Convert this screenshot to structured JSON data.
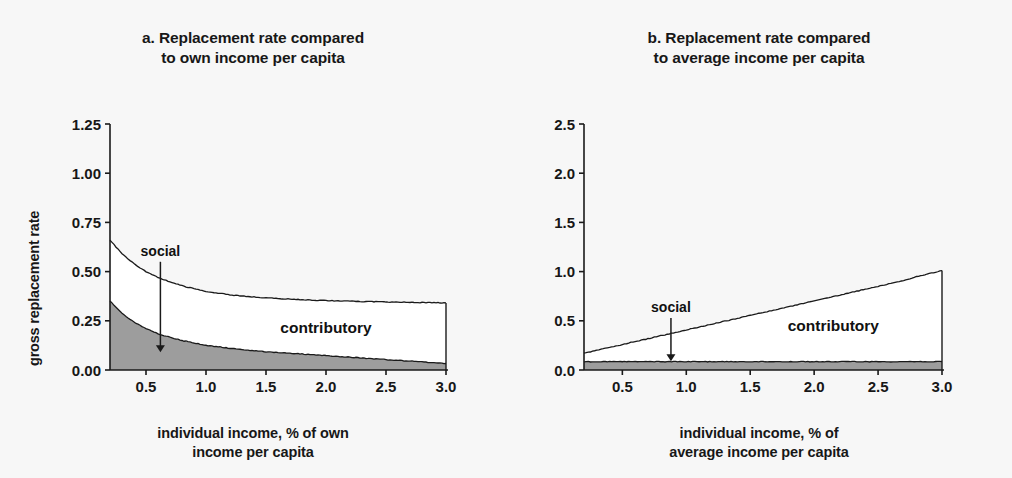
{
  "figure": {
    "background_color": "#f7f7f7",
    "line_color": "#1a1a1a",
    "social_fill_color": "#9d9d9d",
    "contributory_fill_color": "#ffffff"
  },
  "panels": [
    {
      "id": "a",
      "title_line1": "a. Replacement rate compared",
      "title_line2": "to own income per capita",
      "xlabel_line1": "individual income, % of own",
      "xlabel_line2": "income per capita",
      "ylabel": "gross replacement rate",
      "annotation_social": "social",
      "annotation_contributory": "contributory",
      "xticks": [
        "0.5",
        "1.0",
        "1.5",
        "2.0",
        "2.5",
        "3.0"
      ],
      "yticks": [
        "0.00",
        "0.25",
        "0.50",
        "0.75",
        "1.00",
        "1.25"
      ]
    },
    {
      "id": "b",
      "title_line1": "b. Replacement rate compared",
      "title_line2": "to average income per capita",
      "xlabel_line1": "individual income, % of",
      "xlabel_line2": "average income per capita",
      "ylabel": "gross relative pension level",
      "annotation_social": "social",
      "annotation_contributory": "contributory",
      "xticks": [
        "0.5",
        "1.0",
        "1.5",
        "2.0",
        "2.5",
        "3.0"
      ],
      "yticks": [
        "0.0",
        "0.5",
        "1.0",
        "1.5",
        "2.0",
        "2.5"
      ]
    }
  ],
  "chart_data": [
    {
      "type": "area",
      "title": "a. Replacement rate compared to own income per capita",
      "xlabel": "individual income, % of own income per capita",
      "ylabel": "gross replacement rate",
      "xlim": [
        0.2,
        3.0
      ],
      "ylim": [
        0.0,
        1.25
      ],
      "xticks": [
        0.5,
        1.0,
        1.5,
        2.0,
        2.5,
        3.0
      ],
      "yticks": [
        0.0,
        0.25,
        0.5,
        0.75,
        1.0,
        1.25
      ],
      "grid": false,
      "legend": "inline annotations",
      "annotations": [
        {
          "text": "social",
          "x": 0.62,
          "y": 0.56,
          "arrow_to_y": 0.09
        },
        {
          "text": "contributory",
          "x": 2.0,
          "y": 0.19
        }
      ],
      "x": [
        0.2,
        0.3,
        0.4,
        0.5,
        0.6,
        0.7,
        0.8,
        0.9,
        1.0,
        1.1,
        1.2,
        1.3,
        1.4,
        1.5,
        1.6,
        1.7,
        1.8,
        1.9,
        2.0,
        2.1,
        2.2,
        2.3,
        2.4,
        2.5,
        2.6,
        2.7,
        2.8,
        2.9,
        3.0
      ],
      "series": [
        {
          "name": "social",
          "description": "gray shaded lower band: social pension component",
          "values": [
            0.35,
            0.287,
            0.243,
            0.21,
            0.185,
            0.166,
            0.15,
            0.137,
            0.126,
            0.118,
            0.11,
            0.104,
            0.098,
            0.093,
            0.089,
            0.085,
            0.081,
            0.077,
            0.073,
            0.069,
            0.065,
            0.061,
            0.057,
            0.053,
            0.049,
            0.045,
            0.041,
            0.037,
            0.033
          ]
        },
        {
          "name": "total (social + contributory)",
          "description": "upper bounding curve; white band between curves is contributory",
          "values": [
            0.66,
            0.59,
            0.54,
            0.5,
            0.47,
            0.447,
            0.428,
            0.413,
            0.4,
            0.39,
            0.382,
            0.376,
            0.371,
            0.367,
            0.363,
            0.36,
            0.357,
            0.355,
            0.353,
            0.351,
            0.35,
            0.348,
            0.347,
            0.346,
            0.345,
            0.344,
            0.343,
            0.342,
            0.341
          ]
        }
      ]
    },
    {
      "type": "area",
      "title": "b. Replacement rate compared to average income per capita",
      "xlabel": "individual income, % of average income per capita",
      "ylabel": "gross relative pension level",
      "xlim": [
        0.2,
        3.0
      ],
      "ylim": [
        0.0,
        2.5
      ],
      "xticks": [
        0.5,
        1.0,
        1.5,
        2.0,
        2.5,
        3.0
      ],
      "yticks": [
        0.0,
        0.5,
        1.0,
        1.5,
        2.0,
        2.5
      ],
      "grid": false,
      "legend": "inline annotations",
      "annotations": [
        {
          "text": "social",
          "x": 0.88,
          "y": 0.55,
          "arrow_to_y": 0.09
        },
        {
          "text": "contributory",
          "x": 2.15,
          "y": 0.4
        }
      ],
      "x": [
        0.2,
        0.3,
        0.4,
        0.5,
        0.6,
        0.7,
        0.8,
        0.9,
        1.0,
        1.1,
        1.2,
        1.3,
        1.4,
        1.5,
        1.6,
        1.7,
        1.8,
        1.9,
        2.0,
        2.1,
        2.2,
        2.3,
        2.4,
        2.5,
        2.6,
        2.7,
        2.8,
        2.9,
        3.0
      ],
      "series": [
        {
          "name": "social",
          "description": "thin gray shaded band, roughly constant",
          "values": [
            0.085,
            0.085,
            0.085,
            0.085,
            0.085,
            0.085,
            0.085,
            0.085,
            0.085,
            0.085,
            0.085,
            0.085,
            0.085,
            0.085,
            0.085,
            0.085,
            0.085,
            0.085,
            0.085,
            0.085,
            0.085,
            0.085,
            0.085,
            0.085,
            0.085,
            0.085,
            0.085,
            0.085,
            0.085
          ]
        },
        {
          "name": "total (social + contributory)",
          "description": "upper bounding line rising roughly linearly",
          "values": [
            0.17,
            0.2,
            0.23,
            0.259,
            0.289,
            0.318,
            0.348,
            0.377,
            0.407,
            0.436,
            0.466,
            0.495,
            0.525,
            0.554,
            0.584,
            0.613,
            0.643,
            0.672,
            0.702,
            0.731,
            0.761,
            0.79,
            0.82,
            0.849,
            0.879,
            0.908,
            0.95,
            0.98,
            1.01
          ]
        }
      ]
    }
  ]
}
